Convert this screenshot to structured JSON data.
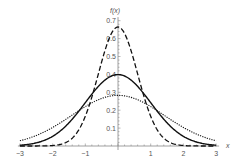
{
  "chart_data": {
    "type": "line",
    "title": "",
    "xlabel": "x",
    "ylabel": "f(x)",
    "xlim": [
      -3,
      3
    ],
    "ylim": [
      0,
      0.7
    ],
    "x_ticks": [
      -3,
      -2,
      -1,
      1,
      2,
      3
    ],
    "x_tick_labels": [
      "−3",
      "−2",
      "−1",
      "1",
      "2",
      "3"
    ],
    "y_ticks": [
      0.1,
      0.2,
      0.3,
      0.4,
      0.5,
      0.6,
      0.7
    ],
    "y_tick_labels": [
      "0.1",
      "0.2",
      "0.3",
      "0.4",
      "0.5",
      "0.6",
      "0.7"
    ],
    "grid": false,
    "legend": null,
    "series": [
      {
        "name": "solid",
        "style": "solid",
        "sigma": 1.0,
        "peak": 0.399,
        "x": [
          -3,
          -2.5,
          -2,
          -1.5,
          -1,
          -0.5,
          0,
          0.5,
          1,
          1.5,
          2,
          2.5,
          3
        ],
        "values": [
          0.004,
          0.018,
          0.054,
          0.13,
          0.242,
          0.352,
          0.399,
          0.352,
          0.242,
          0.13,
          0.054,
          0.018,
          0.004
        ]
      },
      {
        "name": "dashed",
        "style": "dashed",
        "sigma": 0.6,
        "peak": 0.665,
        "x": [
          -3,
          -2.5,
          -2,
          -1.5,
          -1,
          -0.5,
          0,
          0.5,
          1,
          1.5,
          2,
          2.5,
          3
        ],
        "values": [
          0.0,
          0.0,
          0.003,
          0.029,
          0.166,
          0.472,
          0.665,
          0.472,
          0.166,
          0.029,
          0.003,
          0.0,
          0.0
        ]
      },
      {
        "name": "dotted",
        "style": "dotted",
        "sigma": 1.41,
        "peak": 0.283,
        "x": [
          -3,
          -2.5,
          -2,
          -1.5,
          -1,
          -0.5,
          0,
          0.5,
          1,
          1.5,
          2,
          2.5,
          3
        ],
        "values": [
          0.029,
          0.059,
          0.103,
          0.161,
          0.22,
          0.266,
          0.283,
          0.266,
          0.22,
          0.161,
          0.103,
          0.059,
          0.029
        ]
      }
    ]
  },
  "colors": {
    "curve": "#111111",
    "axis": "#888888",
    "label": "#555555"
  }
}
